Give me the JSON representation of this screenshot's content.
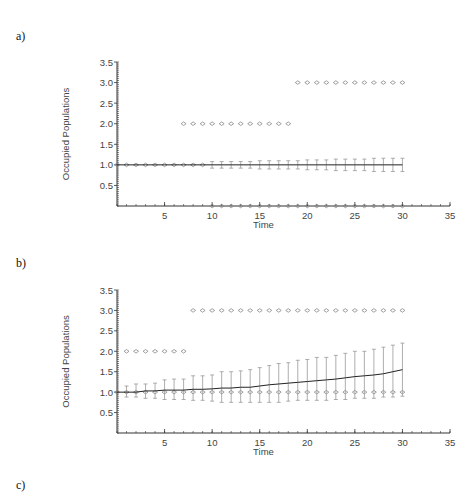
{
  "panels": [
    {
      "label": "a)"
    },
    {
      "label": "b)"
    },
    {
      "label": "c)"
    }
  ],
  "colors": {
    "axis": "#333333",
    "marker": "#888888",
    "errorbar": "#999999",
    "mean_line": "#222222"
  },
  "chart_data": [
    {
      "type": "scatter",
      "title": "a)",
      "xlabel": "Time",
      "ylabel": "Occupied Populations",
      "xlim": [
        0,
        35
      ],
      "ylim": [
        0,
        3.5
      ],
      "xticks": [
        5,
        10,
        15,
        20,
        25,
        30,
        35
      ],
      "yticks": [
        0.5,
        1.0,
        1.5,
        2.0,
        2.5,
        3.0,
        3.5
      ],
      "grid": false,
      "legend": null,
      "series": [
        {
          "name": "replicate level 3.0",
          "marker": "diamond",
          "x": [
            19,
            20,
            21,
            22,
            23,
            24,
            25,
            26,
            27,
            28,
            29,
            30
          ],
          "y": [
            3,
            3,
            3,
            3,
            3,
            3,
            3,
            3,
            3,
            3,
            3,
            3
          ]
        },
        {
          "name": "replicate level 2.0",
          "marker": "diamond",
          "x": [
            7,
            8,
            9,
            10,
            11,
            12,
            13,
            14,
            15,
            16,
            17,
            18
          ],
          "y": [
            2,
            2,
            2,
            2,
            2,
            2,
            2,
            2,
            2,
            2,
            2,
            2
          ]
        },
        {
          "name": "replicate level 1.0",
          "marker": "diamond",
          "x": [
            0,
            1,
            2,
            3,
            4,
            5,
            6,
            7,
            8,
            9
          ],
          "y": [
            1,
            1,
            1,
            1,
            1,
            1,
            1,
            1,
            1,
            1
          ]
        },
        {
          "name": "replicate level 0.0",
          "marker": "diamond",
          "x": [
            10,
            11,
            12,
            13,
            14,
            15,
            16,
            17,
            18,
            19,
            20,
            21,
            22,
            23,
            24,
            25,
            26,
            27,
            28,
            29,
            30
          ],
          "y": [
            0,
            0,
            0,
            0,
            0,
            0,
            0,
            0,
            0,
            0,
            0,
            0,
            0,
            0,
            0,
            0,
            0,
            0,
            0,
            0,
            0
          ]
        },
        {
          "name": "mean",
          "type": "line",
          "x": [
            0,
            1,
            2,
            3,
            4,
            5,
            6,
            7,
            8,
            9,
            10,
            11,
            12,
            13,
            14,
            15,
            16,
            17,
            18,
            19,
            20,
            21,
            22,
            23,
            24,
            25,
            26,
            27,
            28,
            29,
            30
          ],
          "y": [
            1,
            1,
            1,
            1,
            1,
            1,
            1,
            1,
            1,
            1,
            1.0,
            1.0,
            1.0,
            1.0,
            1.0,
            1.0,
            1.0,
            1.0,
            1.0,
            1.0,
            1.0,
            1.0,
            1.0,
            1.0,
            1.0,
            1.0,
            1.0,
            1.0,
            1.0,
            1.0,
            1.0
          ],
          "err": [
            0,
            0,
            0,
            0,
            0,
            0,
            0,
            0,
            0,
            0,
            0.08,
            0.08,
            0.08,
            0.08,
            0.08,
            0.1,
            0.1,
            0.1,
            0.1,
            0.1,
            0.12,
            0.12,
            0.12,
            0.14,
            0.14,
            0.14,
            0.14,
            0.16,
            0.16,
            0.16,
            0.16
          ]
        }
      ]
    },
    {
      "type": "scatter",
      "title": "b)",
      "xlabel": "Time",
      "ylabel": "Occupied Populations",
      "xlim": [
        0,
        35
      ],
      "ylim": [
        0,
        3.5
      ],
      "xticks": [
        5,
        10,
        15,
        20,
        25,
        30,
        35
      ],
      "yticks": [
        0.5,
        1.0,
        1.5,
        2.0,
        2.5,
        3.0,
        3.5
      ],
      "grid": false,
      "legend": null,
      "series": [
        {
          "name": "replicate level 3.0",
          "marker": "diamond",
          "x": [
            8,
            9,
            10,
            11,
            12,
            13,
            14,
            15,
            16,
            17,
            18,
            19,
            20,
            21,
            22,
            23,
            24,
            25,
            26,
            27,
            28,
            29,
            30
          ],
          "y": [
            3,
            3,
            3,
            3,
            3,
            3,
            3,
            3,
            3,
            3,
            3,
            3,
            3,
            3,
            3,
            3,
            3,
            3,
            3,
            3,
            3,
            3,
            3
          ]
        },
        {
          "name": "replicate level 2.0",
          "marker": "diamond",
          "x": [
            1,
            2,
            3,
            4,
            5,
            6,
            7
          ],
          "y": [
            2,
            2,
            2,
            2,
            2,
            2,
            2
          ]
        },
        {
          "name": "replicate level 1.0",
          "marker": "diamond",
          "x": [
            0,
            1,
            2,
            3,
            4,
            5,
            6,
            7,
            8,
            9,
            10,
            11,
            12,
            13,
            14,
            15,
            16,
            17,
            18,
            19,
            20,
            21,
            22,
            23,
            24,
            25,
            26,
            27,
            28,
            29,
            30
          ],
          "y": [
            1,
            1,
            1,
            1,
            1,
            1,
            1,
            1,
            1,
            1,
            1,
            1,
            1,
            1,
            1,
            1,
            1,
            1,
            1,
            1,
            1,
            1,
            1,
            1,
            1,
            1,
            1,
            1,
            1,
            1,
            1
          ]
        },
        {
          "name": "mean",
          "type": "line",
          "x": [
            0,
            1,
            2,
            3,
            4,
            5,
            6,
            7,
            8,
            9,
            10,
            11,
            12,
            13,
            14,
            15,
            16,
            17,
            18,
            19,
            20,
            21,
            22,
            23,
            24,
            25,
            26,
            27,
            28,
            29,
            30
          ],
          "y": [
            1.0,
            1.0,
            1.0,
            1.03,
            1.03,
            1.05,
            1.05,
            1.05,
            1.07,
            1.07,
            1.08,
            1.1,
            1.1,
            1.12,
            1.12,
            1.15,
            1.18,
            1.2,
            1.22,
            1.24,
            1.26,
            1.28,
            1.3,
            1.32,
            1.35,
            1.38,
            1.4,
            1.42,
            1.45,
            1.5,
            1.55
          ],
          "err_upper": [
            1.0,
            1.15,
            1.2,
            1.2,
            1.22,
            1.3,
            1.32,
            1.32,
            1.4,
            1.4,
            1.42,
            1.5,
            1.5,
            1.52,
            1.55,
            1.6,
            1.65,
            1.7,
            1.72,
            1.78,
            1.8,
            1.85,
            1.85,
            1.9,
            1.95,
            2.0,
            2.0,
            2.05,
            2.1,
            2.15,
            2.2
          ],
          "err_lower": [
            1.0,
            0.88,
            0.88,
            0.85,
            0.85,
            0.82,
            0.82,
            0.82,
            0.8,
            0.8,
            0.78,
            0.75,
            0.75,
            0.75,
            0.75,
            0.75,
            0.75,
            0.75,
            0.78,
            0.8,
            0.8,
            0.8,
            0.8,
            0.82,
            0.82,
            0.85,
            0.85,
            0.85,
            0.88,
            0.88,
            0.9
          ]
        }
      ]
    }
  ]
}
